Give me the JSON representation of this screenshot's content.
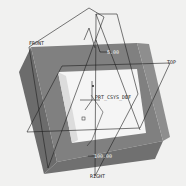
{
  "viewport": {
    "background": "#f1f1f0",
    "frame_color": "#7d7d7d",
    "frame_dark": "#6a6a6a",
    "opening_color": "#f6f6f6",
    "line_color": "#1e1e1e"
  },
  "datum_planes": [
    {
      "name": "FRONT"
    },
    {
      "name": "TOP"
    },
    {
      "name": "RIGHT"
    }
  ],
  "coordinate_system": {
    "label": "PRT_CSYS_DEF"
  },
  "dimensions": [
    {
      "id": "thickness",
      "value": "5.00"
    },
    {
      "id": "width",
      "value": "100.00"
    }
  ]
}
